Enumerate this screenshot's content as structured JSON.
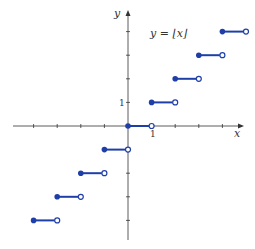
{
  "diagram": {
    "title": "y = ⌊x⌋",
    "x_axis_label": "x",
    "y_axis_label": "y",
    "x_tick_label": "1",
    "y_tick_label": "1",
    "colors": {
      "axis": "#333333",
      "step": "#1f3fa8"
    },
    "origin_px": [
      128,
      126
    ],
    "unit_px": 23.6,
    "x_ticks": [
      -4,
      -3,
      -2,
      -1,
      1,
      2,
      3,
      4
    ],
    "y_ticks": [
      -4,
      -3,
      -2,
      -1,
      1,
      2,
      3,
      4
    ],
    "steps": [
      {
        "x_start": -4,
        "x_end": -3,
        "y": -4
      },
      {
        "x_start": -3,
        "x_end": -2,
        "y": -3
      },
      {
        "x_start": -2,
        "x_end": -1,
        "y": -2
      },
      {
        "x_start": -1,
        "x_end": 0,
        "y": -1
      },
      {
        "x_start": 0,
        "x_end": 1,
        "y": 0
      },
      {
        "x_start": 1,
        "x_end": 2,
        "y": 1
      },
      {
        "x_start": 2,
        "x_end": 3,
        "y": 2
      },
      {
        "x_start": 3,
        "x_end": 4,
        "y": 3
      },
      {
        "x_start": 4,
        "x_end": 5,
        "y": 4
      }
    ]
  }
}
